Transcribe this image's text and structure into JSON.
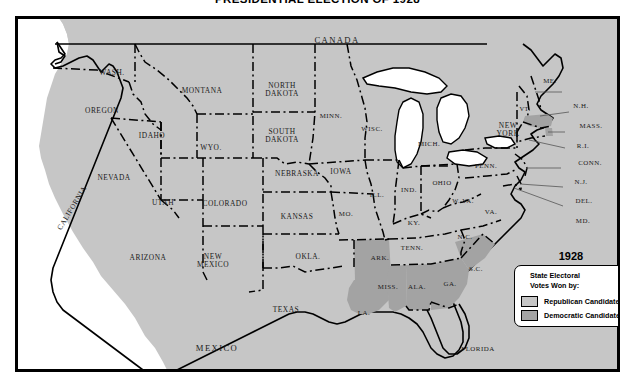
{
  "title": "PRESIDENTIAL ELECTION OF 1928",
  "colors": {
    "republican": "#c6c6c6",
    "democratic": "#a3a3a3",
    "water": "#ffffff",
    "border": "#000000"
  },
  "legend": {
    "year": "1928",
    "heading_line1": "State Electoral",
    "heading_line2": "Votes Won by:",
    "entries": [
      {
        "label": "Republican Candidate",
        "color": "#c6c6c6"
      },
      {
        "label": "Democratic Candidate",
        "color": "#a3a3a3"
      }
    ]
  },
  "countries": [
    {
      "name": "CANADA",
      "x": 320,
      "y": 22
    },
    {
      "name": "MEXICO",
      "x": 200,
      "y": 330
    }
  ],
  "chart_data": {
    "type": "map",
    "title": "PRESIDENTIAL ELECTION OF 1928",
    "legend_title": "State Electoral Votes Won by:",
    "categories": [
      "Republican Candidate",
      "Democratic Candidate"
    ],
    "states": [
      {
        "abbr": "WASH.",
        "party": "Republican"
      },
      {
        "abbr": "OREGON",
        "party": "Republican"
      },
      {
        "abbr": "CALIFORNIA",
        "party": "Republican"
      },
      {
        "abbr": "IDAHO",
        "party": "Republican"
      },
      {
        "abbr": "NEVADA",
        "party": "Republican"
      },
      {
        "abbr": "MONTANA",
        "party": "Republican"
      },
      {
        "abbr": "WYO.",
        "party": "Republican"
      },
      {
        "abbr": "UTAH",
        "party": "Republican"
      },
      {
        "abbr": "ARIZONA",
        "party": "Republican"
      },
      {
        "abbr": "COLORADO",
        "party": "Republican"
      },
      {
        "abbr": "NEW MEXICO",
        "party": "Republican"
      },
      {
        "abbr": "NORTH DAKOTA",
        "party": "Republican"
      },
      {
        "abbr": "SOUTH DAKOTA",
        "party": "Republican"
      },
      {
        "abbr": "NEBRASKA",
        "party": "Republican"
      },
      {
        "abbr": "KANSAS",
        "party": "Republican"
      },
      {
        "abbr": "OKLA.",
        "party": "Republican"
      },
      {
        "abbr": "TEXAS",
        "party": "Republican"
      },
      {
        "abbr": "MINN.",
        "party": "Republican"
      },
      {
        "abbr": "IOWA",
        "party": "Republican"
      },
      {
        "abbr": "MO.",
        "party": "Republican"
      },
      {
        "abbr": "WISC.",
        "party": "Republican"
      },
      {
        "abbr": "ILL.",
        "party": "Republican"
      },
      {
        "abbr": "MICH.",
        "party": "Republican"
      },
      {
        "abbr": "IND.",
        "party": "Republican"
      },
      {
        "abbr": "OHIO",
        "party": "Republican"
      },
      {
        "abbr": "KY.",
        "party": "Republican"
      },
      {
        "abbr": "TENN.",
        "party": "Republican"
      },
      {
        "abbr": "W. VA.",
        "party": "Republican"
      },
      {
        "abbr": "VA.",
        "party": "Republican"
      },
      {
        "abbr": "N.C.",
        "party": "Republican"
      },
      {
        "abbr": "FLORIDA",
        "party": "Republican"
      },
      {
        "abbr": "PENN.",
        "party": "Republican"
      },
      {
        "abbr": "NEW YORK",
        "party": "Republican"
      },
      {
        "abbr": "VT.",
        "party": "Republican"
      },
      {
        "abbr": "ME.",
        "party": "Republican"
      },
      {
        "abbr": "N.H.",
        "party": "Republican"
      },
      {
        "abbr": "CONN.",
        "party": "Republican"
      },
      {
        "abbr": "N.J.",
        "party": "Republican"
      },
      {
        "abbr": "DEL.",
        "party": "Republican"
      },
      {
        "abbr": "MD.",
        "party": "Republican"
      },
      {
        "abbr": "ARK.",
        "party": "Democratic"
      },
      {
        "abbr": "LA.",
        "party": "Democratic"
      },
      {
        "abbr": "MISS.",
        "party": "Democratic"
      },
      {
        "abbr": "ALA.",
        "party": "Democratic"
      },
      {
        "abbr": "GA.",
        "party": "Democratic"
      },
      {
        "abbr": "S.C.",
        "party": "Democratic"
      },
      {
        "abbr": "MASS.",
        "party": "Democratic"
      },
      {
        "abbr": "R.I.",
        "party": "Democratic"
      }
    ]
  },
  "labels": [
    {
      "id": "wash",
      "text": "WASH.",
      "x": 95,
      "y": 55,
      "size": "s-md"
    },
    {
      "id": "oregon",
      "text": "OREGON",
      "x": 85,
      "y": 93,
      "size": "s-md"
    },
    {
      "id": "idaho",
      "text": "IDAHO",
      "x": 135,
      "y": 118,
      "size": "s-md"
    },
    {
      "id": "montana",
      "text": "MONTANA",
      "x": 185,
      "y": 73,
      "size": "s-md"
    },
    {
      "id": "nevada",
      "text": "NEVADA",
      "x": 97,
      "y": 160,
      "size": "s-md"
    },
    {
      "id": "utah",
      "text": "UTAH",
      "x": 146,
      "y": 185,
      "size": "s-md"
    },
    {
      "id": "wyo",
      "text": "WYO.",
      "x": 194,
      "y": 130,
      "size": "s-md"
    },
    {
      "id": "colorado",
      "text": "COLORADO",
      "x": 208,
      "y": 186,
      "size": "s-md"
    },
    {
      "id": "arizona",
      "text": "ARIZONA",
      "x": 131,
      "y": 240,
      "size": "s-md"
    },
    {
      "id": "newmexico",
      "text": "NEW\nMEXICO",
      "x": 196,
      "y": 243,
      "size": "s-md"
    },
    {
      "id": "ndakota",
      "text": "NORTH\nDAKOTA",
      "x": 265,
      "y": 72,
      "size": "s-md"
    },
    {
      "id": "sdakota",
      "text": "SOUTH\nDAKOTA",
      "x": 265,
      "y": 118,
      "size": "s-md"
    },
    {
      "id": "nebraska",
      "text": "NEBRASKA",
      "x": 280,
      "y": 156,
      "size": "s-md"
    },
    {
      "id": "kansas",
      "text": "KANSAS",
      "x": 280,
      "y": 199,
      "size": "s-md"
    },
    {
      "id": "okla",
      "text": "OKLA.",
      "x": 291,
      "y": 239,
      "size": "s-md"
    },
    {
      "id": "texas",
      "text": "TEXAS",
      "x": 269,
      "y": 292,
      "size": "s-md"
    },
    {
      "id": "minn",
      "text": "MINN.",
      "x": 314,
      "y": 98,
      "size": "s-sm"
    },
    {
      "id": "iowa",
      "text": "IOWA",
      "x": 324,
      "y": 154,
      "size": "s-md"
    },
    {
      "id": "mo",
      "text": "MO.",
      "x": 329,
      "y": 196,
      "size": "s-sm"
    },
    {
      "id": "wisc",
      "text": "WISC.",
      "x": 355,
      "y": 111,
      "size": "s-sm"
    },
    {
      "id": "mich",
      "text": "MICH.",
      "x": 412,
      "y": 126,
      "size": "s-sm"
    },
    {
      "id": "ill",
      "text": "ILL.",
      "x": 360,
      "y": 177,
      "size": "s-sm"
    },
    {
      "id": "ind",
      "text": "IND.",
      "x": 392,
      "y": 172,
      "size": "s-sm"
    },
    {
      "id": "ohio",
      "text": "OHIO",
      "x": 425,
      "y": 165,
      "size": "s-sm"
    },
    {
      "id": "ky",
      "text": "KY.",
      "x": 397,
      "y": 205,
      "size": "s-sm"
    },
    {
      "id": "tenn",
      "text": "TENN.",
      "x": 395,
      "y": 230,
      "size": "s-sm"
    },
    {
      "id": "wva",
      "text": "W. VA.",
      "x": 446,
      "y": 183,
      "size": "s-xs"
    },
    {
      "id": "va",
      "text": "VA.",
      "x": 474,
      "y": 194,
      "size": "s-sm"
    },
    {
      "id": "nc",
      "text": "N.C.",
      "x": 448,
      "y": 219,
      "size": "s-sm"
    },
    {
      "id": "sc",
      "text": "S.C.",
      "x": 459,
      "y": 251,
      "size": "s-sm"
    },
    {
      "id": "ga",
      "text": "GA.",
      "x": 433,
      "y": 266,
      "size": "s-sm"
    },
    {
      "id": "ala",
      "text": "ALA.",
      "x": 400,
      "y": 269,
      "size": "s-sm"
    },
    {
      "id": "miss",
      "text": "MISS.",
      "x": 371,
      "y": 269,
      "size": "s-sm"
    },
    {
      "id": "ark",
      "text": "ARK.",
      "x": 363,
      "y": 240,
      "size": "s-sm"
    },
    {
      "id": "la",
      "text": "LA.",
      "x": 347,
      "y": 295,
      "size": "s-sm"
    },
    {
      "id": "florida",
      "text": "FLORIDA",
      "x": 461,
      "y": 331,
      "size": "s-sm"
    },
    {
      "id": "penn",
      "text": "PENN.",
      "x": 469,
      "y": 148,
      "size": "s-sm"
    },
    {
      "id": "newyork",
      "text": "NEW\nYORK",
      "x": 491,
      "y": 112,
      "size": "s-md"
    },
    {
      "id": "vt",
      "text": "VT.",
      "x": 508,
      "y": 91,
      "size": "s-xs"
    },
    {
      "id": "me",
      "text": "ME.",
      "x": 533,
      "y": 63,
      "size": "s-sm"
    },
    {
      "id": "nh",
      "text": "N.H.",
      "x": 564,
      "y": 88,
      "size": "s-sm"
    },
    {
      "id": "mass",
      "text": "MASS.",
      "x": 574,
      "y": 108,
      "size": "s-sm"
    },
    {
      "id": "ri",
      "text": "R.I.",
      "x": 566,
      "y": 128,
      "size": "s-sm"
    },
    {
      "id": "conn",
      "text": "CONN.",
      "x": 573,
      "y": 145,
      "size": "s-sm"
    },
    {
      "id": "nj",
      "text": "N.J.",
      "x": 564,
      "y": 164,
      "size": "s-sm"
    },
    {
      "id": "del",
      "text": "DEL.",
      "x": 567,
      "y": 183,
      "size": "s-sm"
    },
    {
      "id": "md",
      "text": "MD.",
      "x": 566,
      "y": 203,
      "size": "s-sm"
    },
    {
      "id": "california",
      "text": "CALIFORNIA",
      "x": 55,
      "y": 190,
      "size": "s-md",
      "rot": true
    }
  ]
}
